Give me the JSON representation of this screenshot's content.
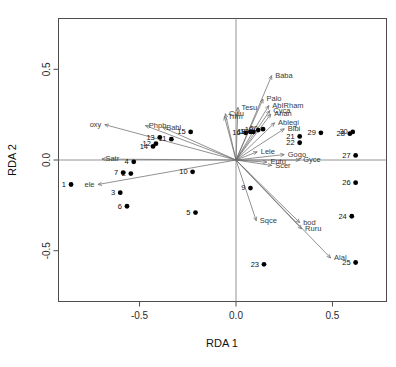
{
  "chart_data": {
    "type": "scatter",
    "title": "",
    "xlabel": "RDA 1",
    "ylabel": "RDA 2",
    "xlim": [
      -0.92,
      0.78
    ],
    "ylim": [
      -0.78,
      0.78
    ],
    "xticks": [
      -0.5,
      0.0,
      0.5
    ],
    "xticklabels": [
      "-0.5",
      "0.0",
      "0.5"
    ],
    "yticks": [
      0.5,
      0.0,
      -0.5
    ],
    "yticklabels": [
      "0.5",
      "0.0",
      "-0.5"
    ],
    "grid": false,
    "legend": "none",
    "zero_lines": true,
    "sites": [
      {
        "label": "1",
        "x": -0.855,
        "y": -0.135
      },
      {
        "label": "2",
        "x": -0.545,
        "y": -0.075
      },
      {
        "label": "3",
        "x": -0.6,
        "y": -0.18
      },
      {
        "label": "4",
        "x": -0.53,
        "y": -0.01
      },
      {
        "label": "5",
        "x": -0.21,
        "y": -0.29
      },
      {
        "label": "6",
        "x": -0.565,
        "y": -0.255
      },
      {
        "label": "7",
        "x": -0.585,
        "y": -0.07
      },
      {
        "label": "9",
        "x": 0.075,
        "y": -0.155
      },
      {
        "label": "10",
        "x": -0.225,
        "y": -0.065
      },
      {
        "label": "11",
        "x": -0.335,
        "y": 0.115
      },
      {
        "label": "12",
        "x": -0.415,
        "y": 0.09
      },
      {
        "label": "13",
        "x": -0.395,
        "y": 0.125
      },
      {
        "label": "14",
        "x": -0.43,
        "y": 0.075
      },
      {
        "label": "15",
        "x": -0.235,
        "y": 0.155
      },
      {
        "label": "16",
        "x": 0.05,
        "y": 0.15
      },
      {
        "label": "17",
        "x": 0.09,
        "y": 0.155
      },
      {
        "label": "18",
        "x": 0.075,
        "y": 0.155
      },
      {
        "label": "19",
        "x": 0.115,
        "y": 0.165
      },
      {
        "label": "20",
        "x": 0.14,
        "y": 0.17
      },
      {
        "label": "21",
        "x": 0.33,
        "y": 0.13
      },
      {
        "label": "22",
        "x": 0.33,
        "y": 0.095
      },
      {
        "label": "23",
        "x": 0.145,
        "y": -0.575
      },
      {
        "label": "24",
        "x": 0.6,
        "y": -0.31
      },
      {
        "label": "25",
        "x": 0.62,
        "y": -0.565
      },
      {
        "label": "26",
        "x": 0.62,
        "y": -0.125
      },
      {
        "label": "27",
        "x": 0.62,
        "y": 0.025
      },
      {
        "label": "28",
        "x": 0.59,
        "y": 0.145
      },
      {
        "label": "29",
        "x": 0.44,
        "y": 0.15
      },
      {
        "label": "30",
        "x": 0.605,
        "y": 0.155
      }
    ],
    "arrows": [
      {
        "label": "oxy",
        "x": -0.68,
        "y": 0.195,
        "anchor": "end"
      },
      {
        "label": "Phph",
        "x": -0.47,
        "y": 0.19,
        "anchor": "start"
      },
      {
        "label": "Babl",
        "x": -0.38,
        "y": 0.18,
        "anchor": "start"
      },
      {
        "label": "Satr",
        "x": -0.695,
        "y": 0.005,
        "anchor": "start"
      },
      {
        "label": "ele",
        "x": -0.715,
        "y": -0.135,
        "anchor": "end"
      },
      {
        "label": "Baba",
        "x": 0.185,
        "y": 0.465,
        "anchor": "start"
      },
      {
        "label": "Palo",
        "x": 0.14,
        "y": 0.335,
        "anchor": "start"
      },
      {
        "label": "AbIRham",
        "x": 0.17,
        "y": 0.3,
        "anchor": "start"
      },
      {
        "label": "Cyca",
        "x": 0.175,
        "y": 0.272,
        "anchor": "start"
      },
      {
        "label": "Anan",
        "x": 0.18,
        "y": 0.252,
        "anchor": "start"
      },
      {
        "label": "Ablegi",
        "x": 0.2,
        "y": 0.205,
        "anchor": "start"
      },
      {
        "label": "Blbi",
        "x": 0.25,
        "y": 0.172,
        "anchor": "start"
      },
      {
        "label": "Tesu",
        "x": 0.01,
        "y": 0.29,
        "anchor": "start"
      },
      {
        "label": "Cylu",
        "x": -0.055,
        "y": 0.255,
        "anchor": "start"
      },
      {
        "label": "Trim",
        "x": -0.06,
        "y": 0.24,
        "anchor": "start"
      },
      {
        "label": "Lele",
        "x": 0.11,
        "y": 0.045,
        "anchor": "start"
      },
      {
        "label": "Gogo",
        "x": 0.25,
        "y": 0.03,
        "anchor": "start"
      },
      {
        "label": "Gyce",
        "x": 0.33,
        "y": 0.0,
        "anchor": "start"
      },
      {
        "label": "Eutu",
        "x": 0.16,
        "y": -0.012,
        "anchor": "start"
      },
      {
        "label": "Scer",
        "x": 0.185,
        "y": -0.03,
        "anchor": "start"
      },
      {
        "label": "Sqce",
        "x": 0.105,
        "y": -0.335,
        "anchor": "start"
      },
      {
        "label": "bod",
        "x": 0.33,
        "y": -0.345,
        "anchor": "start"
      },
      {
        "label": "Ruru",
        "x": 0.34,
        "y": -0.38,
        "anchor": "start"
      },
      {
        "label": "Alal",
        "x": 0.49,
        "y": -0.54,
        "anchor": "start"
      }
    ]
  }
}
